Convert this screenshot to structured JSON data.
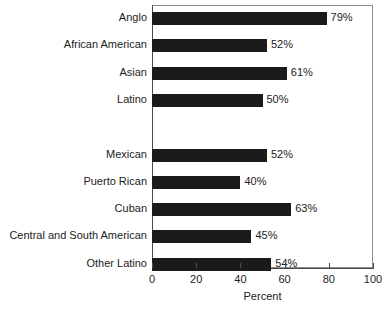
{
  "chart_data": {
    "type": "bar",
    "orientation": "horizontal",
    "title": "",
    "xlabel": "Percent",
    "ylabel": "",
    "xlim": [
      0,
      100
    ],
    "xticks": [
      0,
      20,
      40,
      60,
      80,
      100
    ],
    "xtick_labels": [
      "0",
      "20",
      "40",
      "60",
      "80",
      "100"
    ],
    "grid": false,
    "legend": false,
    "value_label_suffix": "%",
    "bar_color": "#1b1b1b",
    "frame_color": "#8d8d8d",
    "groups": [
      {
        "name": "",
        "categories": [
          "Anglo",
          "African American",
          "Asian",
          "Latino"
        ],
        "values": [
          79,
          52,
          61,
          50
        ],
        "value_labels": [
          "79%",
          "52%",
          "61%",
          "50%"
        ]
      },
      {
        "name": "",
        "categories": [
          "Mexican",
          "Puerto Rican",
          "Cuban",
          "Central and South American",
          "Other Latino"
        ],
        "values": [
          52,
          40,
          63,
          45,
          54
        ],
        "value_labels": [
          "52%",
          "40%",
          "63%",
          "45%",
          "54%"
        ]
      }
    ],
    "categories": [
      "Anglo",
      "African American",
      "Asian",
      "Latino",
      "Mexican",
      "Puerto Rican",
      "Cuban",
      "Central and South American",
      "Other Latino"
    ],
    "values": [
      79,
      52,
      61,
      50,
      52,
      40,
      63,
      45,
      54
    ]
  },
  "rows": [
    {
      "label": "Anglo",
      "value": 79,
      "value_label": "79%",
      "slot": 0
    },
    {
      "label": "African American",
      "value": 52,
      "value_label": "52%",
      "slot": 1
    },
    {
      "label": "Asian",
      "value": 61,
      "value_label": "61%",
      "slot": 2
    },
    {
      "label": "Latino",
      "value": 50,
      "value_label": "50%",
      "slot": 3
    },
    {
      "label": "Mexican",
      "value": 52,
      "value_label": "52%",
      "slot": 5
    },
    {
      "label": "Puerto Rican",
      "value": 40,
      "value_label": "40%",
      "slot": 6
    },
    {
      "label": "Cuban",
      "value": 63,
      "value_label": "63%",
      "slot": 7
    },
    {
      "label": "Central and South American",
      "value": 45,
      "value_label": "45%",
      "slot": 8
    },
    {
      "label": "Other Latino",
      "value": 54,
      "value_label": "54%",
      "slot": 9
    }
  ],
  "axis": {
    "title": "Percent",
    "ticks": [
      {
        "value": 0,
        "label": "0"
      },
      {
        "value": 20,
        "label": "20"
      },
      {
        "value": 40,
        "label": "40"
      },
      {
        "value": 60,
        "label": "60"
      },
      {
        "value": 80,
        "label": "80"
      },
      {
        "value": 100,
        "label": "100"
      }
    ]
  }
}
